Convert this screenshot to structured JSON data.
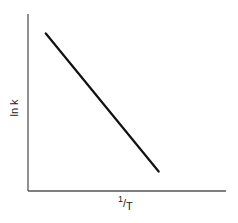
{
  "chart_data": {
    "type": "line",
    "title": "",
    "xlabel": "1/T",
    "ylabel": "ln k",
    "xlabel_parts": {
      "numerator": "1",
      "slash": "/",
      "denominator": "T"
    },
    "grid": false,
    "legend": null,
    "ticks": {
      "x": [],
      "y": []
    },
    "series": [
      {
        "name": "ln k vs 1/T",
        "color": "#111111",
        "x": [
          0.09,
          0.66
        ],
        "y": [
          0.89,
          0.11
        ]
      }
    ],
    "xlim": [
      0,
      1
    ],
    "ylim": [
      0,
      1
    ],
    "annotations": []
  }
}
